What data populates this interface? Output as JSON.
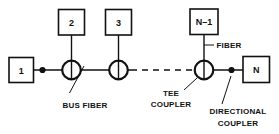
{
  "diagram": {
    "colors": {
      "ink": "#111111",
      "background": "#ffffff"
    },
    "nodes": [
      {
        "id": "node-1",
        "label": "1",
        "position": "bus-left-terminal"
      },
      {
        "id": "node-2",
        "label": "2",
        "position": "above-first-tee-coupler"
      },
      {
        "id": "node-3",
        "label": "3",
        "position": "above-second-tee-coupler"
      },
      {
        "id": "node-n-1",
        "label": "N–1",
        "position": "above-last-tee-coupler"
      },
      {
        "id": "node-n",
        "label": "N",
        "position": "bus-right-terminal"
      }
    ],
    "annotations": [
      {
        "id": "bus-fiber",
        "label": "BUS FIBER",
        "lines": [
          "BUS FIBER"
        ]
      },
      {
        "id": "fiber",
        "label": "FIBER",
        "lines": [
          "FIBER"
        ]
      },
      {
        "id": "tee-coupler",
        "label": "TEE COUPLER",
        "lines": [
          "TEE",
          "COUPLER"
        ]
      },
      {
        "id": "directional-coupler",
        "label": "DIRECTIONAL COUPLER",
        "lines": [
          "DIRECTIONAL",
          "COUPLER"
        ]
      }
    ],
    "components": {
      "tee_coupler_count": 3,
      "directional_coupler_count": 2,
      "bus_continuation": "dashed"
    }
  }
}
